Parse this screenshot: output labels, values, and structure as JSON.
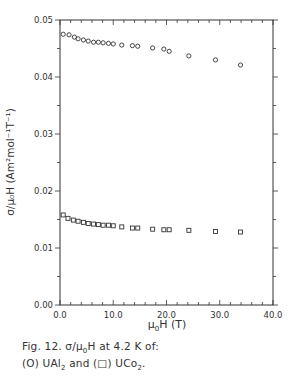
{
  "chart_data": {
    "type": "scatter",
    "title": "",
    "xlabel": "μ0H (T)",
    "ylabel": "σ/μ0H (Am²mol⁻¹T⁻¹)",
    "xlim": [
      0,
      40
    ],
    "ylim": [
      0,
      0.05
    ],
    "x_ticks": [
      "0.0",
      "10.0",
      "20.0",
      "30.0",
      "40.0"
    ],
    "y_ticks": [
      "0.00",
      "0.01",
      "0.02",
      "0.03",
      "0.04",
      "0.05"
    ],
    "grid": false,
    "legend": "in caption",
    "series": [
      {
        "name": "UAl2",
        "marker": "circle",
        "x": [
          0.6,
          1.7,
          2.7,
          3.4,
          4.4,
          5.3,
          6.3,
          7.2,
          8.1,
          9.1,
          10.0,
          11.6,
          13.6,
          14.6,
          17.4,
          19.5,
          20.5,
          24.2,
          29.2,
          33.9
        ],
        "y": [
          0.0475,
          0.0474,
          0.047,
          0.0467,
          0.0465,
          0.0463,
          0.0461,
          0.0461,
          0.046,
          0.0459,
          0.0458,
          0.0456,
          0.0455,
          0.0454,
          0.0451,
          0.0449,
          0.0445,
          0.0437,
          0.043,
          0.0421
        ]
      },
      {
        "name": "UCo2",
        "marker": "square",
        "x": [
          0.6,
          1.5,
          2.5,
          3.4,
          4.4,
          5.3,
          6.3,
          7.2,
          8.1,
          9.1,
          10.0,
          11.6,
          13.6,
          14.6,
          17.4,
          19.5,
          20.5,
          24.2,
          29.2,
          33.9
        ],
        "y": [
          0.0158,
          0.0152,
          0.0149,
          0.0147,
          0.0145,
          0.0143,
          0.0142,
          0.0141,
          0.014,
          0.014,
          0.0139,
          0.0137,
          0.0135,
          0.0135,
          0.0133,
          0.0132,
          0.0132,
          0.0131,
          0.0129,
          0.0128
        ]
      }
    ]
  },
  "labels": {
    "xlabel_main": "μ",
    "xlabel_sub": "0",
    "xlabel_rest": "H  (T)",
    "ylabel": "σ/μ₀H  (Am²mol⁻¹T⁻¹)"
  },
  "caption": {
    "line1_prefix": "Fig. 12.   σ/μ",
    "line1_sub": "0",
    "line1_suffix": "H  at  4.2  K  of:",
    "line2_a": "(O)  UAl",
    "line2_a_sub": "2",
    "line2_b": "  and  (□)  UCo",
    "line2_b_sub": "2",
    "line2_end": "."
  },
  "colors": {
    "ink": "#333333",
    "background": "#ffffff"
  }
}
